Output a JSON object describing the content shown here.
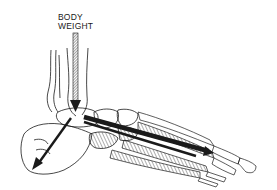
{
  "diagram": {
    "labels": {
      "line1": "BODY",
      "line2": "WEIGHT"
    },
    "arrows": [
      {
        "name": "body-weight-arrow",
        "direction": "down",
        "description": "vertical load through tibia into talus"
      },
      {
        "name": "heel-force-arrow",
        "direction": "down-back",
        "description": "force toward calcaneus (heel)"
      },
      {
        "name": "forefoot-force-arrow",
        "direction": "down-forward",
        "description": "force along metatarsals toward ball of foot"
      }
    ],
    "colors": {
      "ink": "#1a1a1a",
      "background": "#ffffff"
    }
  }
}
